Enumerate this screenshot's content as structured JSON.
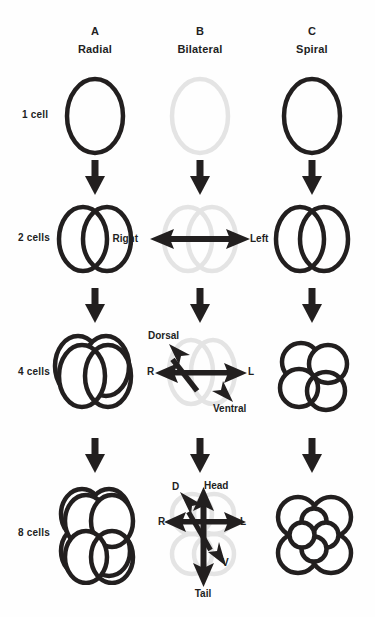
{
  "figure": {
    "background_color": "#fefefe",
    "ink_color": "#221f1f",
    "ghost_color": "#e4e4e4"
  },
  "columns": [
    {
      "letter": "A",
      "name": "Radial",
      "center_x": 95
    },
    {
      "letter": "B",
      "name": "Bilateral",
      "center_x": 200
    },
    {
      "letter": "C",
      "name": "Spiral",
      "center_x": 312
    }
  ],
  "rows": [
    {
      "label": "1 cell",
      "center_y": 115
    },
    {
      "label": "2 cells",
      "center_y": 238
    },
    {
      "label": "4 cells",
      "center_y": 372
    },
    {
      "label": "8 cells",
      "center_y": 533
    }
  ],
  "axes": {
    "two_cell": {
      "right": "Right",
      "left": "Left"
    },
    "four_cell": {
      "dorsal": "Dorsal",
      "ventral": "Ventral",
      "right": "R",
      "left": "L"
    },
    "eight_cell": {
      "dorsal": "D",
      "ventral": "V",
      "right": "R",
      "left": "L",
      "head": "Head",
      "tail": "Tail"
    }
  },
  "icons": {
    "transition": "down-arrow-icon",
    "axis_two": "double-headed-arrow-icon",
    "axis_four": "crossed-double-arrows-icon",
    "axis_eight": "triple-crossed-arrows-icon"
  }
}
